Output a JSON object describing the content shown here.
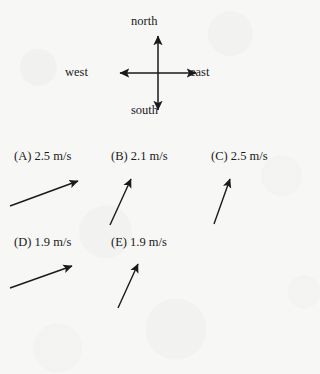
{
  "document": {
    "type": "physics-multiple-choice-question",
    "background_color": "#f7f7f6",
    "ink_color": "#1a1a1a"
  },
  "compass": {
    "name": "compass-rose",
    "north_label": "north",
    "south_label": "south",
    "west_label": "west",
    "east_label": "east",
    "center": {
      "x": 158,
      "y": 72
    },
    "arm_length_px": 34,
    "arrowheads": "both-ends-each-axis"
  },
  "options": [
    {
      "id": "A",
      "label": "(A) 2.5 m/s",
      "magnitude": 2.5,
      "unit": "m/s",
      "arrow_angle_deg": 20,
      "arrow_direction": "up-right-shallow",
      "arrow_length_px": 72
    },
    {
      "id": "B",
      "label": "(B) 2.1 m/s",
      "magnitude": 2.1,
      "unit": "m/s",
      "arrow_angle_deg": 67,
      "arrow_direction": "up-right-steep",
      "arrow_length_px": 48
    },
    {
      "id": "C",
      "label": "(C) 2.5 m/s",
      "magnitude": 2.5,
      "unit": "m/s",
      "arrow_angle_deg": 71,
      "arrow_direction": "up-right-steep",
      "arrow_length_px": 46
    },
    {
      "id": "D",
      "label": "(D) 1.9 m/s",
      "magnitude": 1.9,
      "unit": "m/s",
      "arrow_angle_deg": 18,
      "arrow_direction": "up-right-shallow",
      "arrow_length_px": 66
    },
    {
      "id": "E",
      "label": "(E) 1.9 m/s",
      "magnitude": 1.9,
      "unit": "m/s",
      "arrow_angle_deg": 65,
      "arrow_direction": "up-right-steep",
      "arrow_length_px": 44
    }
  ]
}
